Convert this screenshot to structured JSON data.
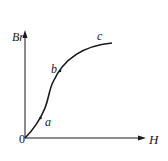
{
  "diagram": {
    "type": "magnetization-curve",
    "y_axis_label": "Br",
    "x_axis_label": "H",
    "origin_label": "0",
    "points": [
      {
        "label": "a"
      },
      {
        "label": "b"
      },
      {
        "label": "c"
      }
    ],
    "colors": {
      "line": "#1a1a1a",
      "background": "#ffffff"
    }
  }
}
